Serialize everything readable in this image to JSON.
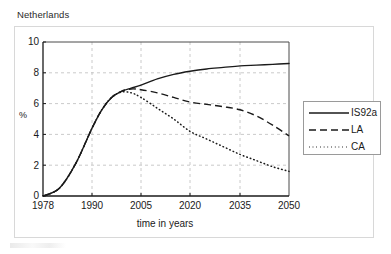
{
  "chart_data": {
    "type": "line",
    "title": "Netherlands",
    "xlabel": "time in years",
    "ylabel": "%",
    "xlim": [
      1978,
      2050
    ],
    "ylim": [
      0,
      10
    ],
    "xticks": [
      "1978",
      "1990",
      "2005",
      "2020",
      "2035",
      "2050"
    ],
    "xtick_values": [
      1978,
      1990,
      2005,
      2020,
      2035,
      2050
    ],
    "yticks": [
      "0",
      "2",
      "4",
      "6",
      "8",
      "10"
    ],
    "ytick_values": [
      0,
      2,
      4,
      6,
      8,
      10
    ],
    "grid": true,
    "grid_style": "dashed",
    "legend_position": "right",
    "x": [
      1978,
      1982,
      1986,
      1990,
      1993,
      1996,
      1999,
      2002,
      2005,
      2010,
      2015,
      2020,
      2025,
      2030,
      2035,
      2040,
      2045,
      2050
    ],
    "series": [
      {
        "name": "IS92a",
        "style": "solid",
        "color": "#1a1a1a",
        "values": [
          0.0,
          0.5,
          2.1,
          4.4,
          5.6,
          6.4,
          6.8,
          7.0,
          7.2,
          7.6,
          7.9,
          8.1,
          8.25,
          8.35,
          8.45,
          8.5,
          8.55,
          8.6
        ]
      },
      {
        "name": "LA",
        "style": "dashed",
        "color": "#1a1a1a",
        "values": [
          0.0,
          0.5,
          2.1,
          4.4,
          5.6,
          6.4,
          6.8,
          6.95,
          6.9,
          6.7,
          6.4,
          6.1,
          5.95,
          5.8,
          5.6,
          5.2,
          4.6,
          3.9
        ]
      },
      {
        "name": "CA",
        "style": "dotted",
        "color": "#1a1a1a",
        "values": [
          0.0,
          0.5,
          2.1,
          4.4,
          5.6,
          6.4,
          6.75,
          6.7,
          6.4,
          5.7,
          5.0,
          4.2,
          3.7,
          3.2,
          2.7,
          2.3,
          1.9,
          1.6
        ]
      }
    ]
  },
  "legend": {
    "items": [
      {
        "label": "IS92a",
        "style": "solid"
      },
      {
        "label": "LA",
        "style": "dashed"
      },
      {
        "label": "CA",
        "style": "dotted"
      }
    ]
  }
}
